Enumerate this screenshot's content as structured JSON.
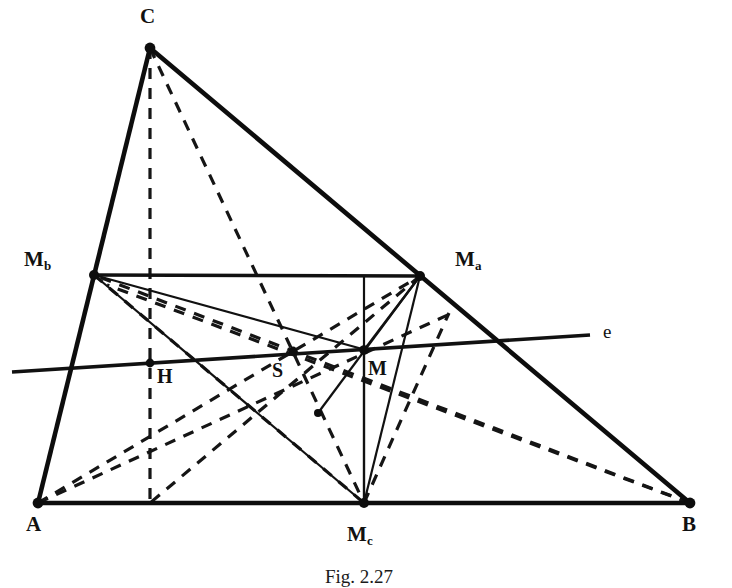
{
  "figure": {
    "caption": "Fig. 2.27",
    "colors": {
      "ink": "#111111",
      "background": "#ffffff"
    },
    "stroke_widths": {
      "triangle": 4.4,
      "medial": 3.2,
      "solid_thin": 2.1,
      "euler": 3.4,
      "dashed": 3.2
    },
    "dash_pattern": "11 9"
  },
  "points": {
    "A": {
      "label": "A",
      "x": 38,
      "y": 503,
      "label_x": 28,
      "label_y": 520,
      "role": "triangle-vertex"
    },
    "B": {
      "label": "B",
      "x": 690,
      "y": 503,
      "label_x": 684,
      "label_y": 520,
      "role": "triangle-vertex"
    },
    "C": {
      "label": "C",
      "x": 150,
      "y": 48,
      "label_x": 140,
      "label_y": 8,
      "role": "triangle-vertex"
    },
    "Ma": {
      "label": "M",
      "sub": "a",
      "x": 420,
      "y": 276,
      "label_x": 455,
      "label_y": 252,
      "role": "midpoint-of-BC"
    },
    "Mb": {
      "label": "M",
      "sub": "b",
      "x": 94,
      "y": 275,
      "label_x": 26,
      "label_y": 252,
      "role": "midpoint-of-CA"
    },
    "Mc": {
      "label": "M",
      "sub": "c",
      "x": 364,
      "y": 503,
      "label_x": 348,
      "label_y": 528,
      "role": "midpoint-of-AB"
    },
    "H": {
      "label": "H",
      "x": 150,
      "y": 363,
      "label_x": 157,
      "label_y": 366,
      "role": "orthocenter"
    },
    "S": {
      "label": "S",
      "x": 293,
      "y": 351,
      "label_x": 272,
      "label_y": 360,
      "role": "centroid"
    },
    "M": {
      "label": "M",
      "x": 364,
      "y": 350,
      "label_x": 368,
      "label_y": 358,
      "role": "circumcenter"
    },
    "N": {
      "label": "",
      "x": 257,
      "y": 356,
      "role": "nine-point-center-aux"
    },
    "F": {
      "label": "",
      "x": 318,
      "y": 413,
      "role": "feuerbach-aux"
    }
  },
  "euler_line": {
    "label": "e",
    "x1": 12,
    "y1": 372,
    "x2": 590,
    "y2": 335,
    "label_x": 603,
    "label_y": 322
  },
  "segments": {
    "triangle": [
      {
        "name": "side-AB",
        "from": "A",
        "to": "B"
      },
      {
        "name": "side-BC",
        "from": "B",
        "to": "C"
      },
      {
        "name": "side-CA",
        "from": "C",
        "to": "A"
      }
    ],
    "medial_triangle": [
      {
        "name": "medial-Mb-Ma",
        "from": "Mb",
        "to": "Ma"
      },
      {
        "name": "medial-Ma-Mc",
        "from": "Ma",
        "to": "Mc"
      },
      {
        "name": "medial-Mc-Mb",
        "from": "Mc",
        "to": "Mb"
      }
    ],
    "perpendicular_bisectors": [
      {
        "name": "perp-bisector-AB",
        "x1": 364,
        "y1": 276,
        "x2": 364,
        "y2": 503
      },
      {
        "name": "perp-bisector-BC",
        "x1": 420,
        "y1": 276,
        "x2": 318,
        "y2": 413
      },
      {
        "name": "perp-bisector-CA",
        "x1": 94,
        "y1": 275,
        "x2": 364,
        "y2": 350
      }
    ],
    "medians_dashed": [
      {
        "name": "median-A-Ma",
        "from": "A",
        "to": "Ma"
      },
      {
        "name": "median-B-Mb",
        "from": "B",
        "to": "Mb"
      },
      {
        "name": "median-C-Mc",
        "from": "C",
        "to": "Mc"
      }
    ],
    "altitudes_dashed": [
      {
        "name": "altitude-from-C",
        "x1": 150,
        "y1": 48,
        "x2": 150,
        "y2": 503
      },
      {
        "name": "altitude-from-A",
        "x1": 38,
        "y1": 503,
        "x2": 449,
        "y2": 315
      },
      {
        "name": "altitude-from-B",
        "x1": 690,
        "y1": 503,
        "x2": 109,
        "y2": 286
      }
    ],
    "medial_medians_dashed": [
      {
        "name": "medial-median-Ma-Mbc",
        "from": "Ma",
        "to": "Mc"
      },
      {
        "name": "medial-cevian-Mb-Mc",
        "from": "Mb",
        "to": "Mc"
      }
    ]
  },
  "roles_legend": {
    "H": "orthocenter",
    "S": "centroid",
    "M": "circumcenter",
    "e": "Euler line",
    "Ma": "midpoint of BC",
    "Mb": "midpoint of CA",
    "Mc": "midpoint of AB"
  }
}
